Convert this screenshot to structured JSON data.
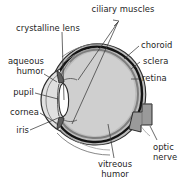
{
  "figure": {
    "type": "anatomical-diagram",
    "background_color": "#ffffff",
    "ink_color": "#1d1d1d"
  },
  "palette": {
    "vitreous_fill": "#cfcfcf",
    "sclera_fill": "#bdbdbd",
    "choroid_fill": "#1a1a1a",
    "retina_fill": "#8f8f8f",
    "lens_fill": "#ffffff",
    "aqueous_fill": "#e2e2e2",
    "iris_fill": "#6e6e6e",
    "optic_nerve_fill": "#9a9a9a",
    "outline": "#2b2b2b",
    "leader_line": "#3a3a3a"
  },
  "labels": [
    {
      "id": "ciliary-muscles",
      "line1": "ciliary muscles",
      "line2": ""
    },
    {
      "id": "crystalline-lens",
      "line1": "crystalline lens",
      "line2": ""
    },
    {
      "id": "aqueous-humor",
      "line1": "aqueous",
      "line2": "humor"
    },
    {
      "id": "pupil",
      "line1": "pupil",
      "line2": ""
    },
    {
      "id": "cornea",
      "line1": "cornea",
      "line2": ""
    },
    {
      "id": "iris",
      "line1": "iris",
      "line2": ""
    },
    {
      "id": "choroid",
      "line1": "choroid",
      "line2": ""
    },
    {
      "id": "sclera",
      "line1": "sclera",
      "line2": ""
    },
    {
      "id": "retina",
      "line1": "retina",
      "line2": ""
    },
    {
      "id": "optic-nerve",
      "line1": "optic",
      "line2": "nerve"
    },
    {
      "id": "vitreous-humor",
      "line1": "vitreous",
      "line2": "humor"
    }
  ]
}
